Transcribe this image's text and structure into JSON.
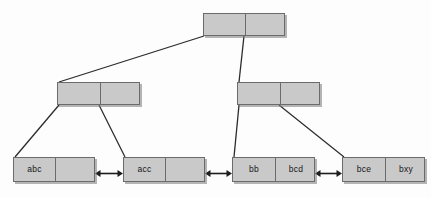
{
  "diagram": {
    "kind": "b-plus-tree",
    "title": "",
    "canvas": {
      "width": 431,
      "height": 197,
      "background": "#fdfdfd"
    },
    "style": {
      "node_fill": "#c9c9c9",
      "node_border": "#6b6b6b",
      "edge_color": "#2b2b2b",
      "text_color": "#16161a",
      "shadow_color": "#787878"
    },
    "levels": [
      {
        "name": "root-level",
        "nodes": [
          {
            "id": "root",
            "role": "root-node",
            "x": 203,
            "y": 13,
            "width": 82,
            "height": 23,
            "cells": [
              {
                "label": "",
                "width": 41
              },
              {
                "label": "",
                "width": 41
              }
            ]
          }
        ]
      },
      {
        "name": "internal-level",
        "nodes": [
          {
            "id": "internal-left",
            "role": "internal-node",
            "x": 57,
            "y": 82,
            "width": 83,
            "height": 23,
            "cells": [
              {
                "label": "",
                "width": 42
              },
              {
                "label": "",
                "width": 41
              }
            ]
          },
          {
            "id": "internal-right",
            "role": "internal-node",
            "x": 237,
            "y": 82,
            "width": 83,
            "height": 23,
            "cells": [
              {
                "label": "",
                "width": 42
              },
              {
                "label": "",
                "width": 41
              }
            ]
          }
        ]
      },
      {
        "name": "leaf-level",
        "nodes": [
          {
            "id": "leaf-abc",
            "role": "leaf-node",
            "x": 13,
            "y": 157,
            "width": 82,
            "height": 25,
            "cells": [
              {
                "label": "abc",
                "width": 41
              },
              {
                "label": "",
                "width": 41
              }
            ]
          },
          {
            "id": "leaf-acc",
            "role": "leaf-node",
            "x": 123,
            "y": 157,
            "width": 82,
            "height": 25,
            "cells": [
              {
                "label": "acc",
                "width": 41
              },
              {
                "label": "",
                "width": 41
              }
            ]
          },
          {
            "id": "leaf-bb-bcd",
            "role": "leaf-node",
            "x": 232,
            "y": 157,
            "width": 83,
            "height": 25,
            "cells": [
              {
                "label": "bb",
                "width": 42
              },
              {
                "label": "bcd",
                "width": 41
              }
            ]
          },
          {
            "id": "leaf-bce-bxy",
            "role": "leaf-node",
            "x": 342,
            "y": 157,
            "width": 83,
            "height": 25,
            "cells": [
              {
                "label": "bce",
                "width": 42
              },
              {
                "label": "bxy",
                "width": 41
              }
            ]
          }
        ]
      }
    ],
    "edges": [
      {
        "name": "edge-root-to-internal-left",
        "x1": 204,
        "y1": 36,
        "x2": 59,
        "y2": 82
      },
      {
        "name": "edge-root-to-internal-right",
        "x1": 244,
        "y1": 36,
        "x2": 239,
        "y2": 82
      },
      {
        "name": "edge-internal-left-to-leaf-abc",
        "x1": 59,
        "y1": 105,
        "x2": 15,
        "y2": 157
      },
      {
        "name": "edge-internal-left-to-leaf-acc",
        "x1": 99,
        "y1": 105,
        "x2": 125,
        "y2": 157
      },
      {
        "name": "edge-internal-right-to-leaf-bb",
        "x1": 239,
        "y1": 105,
        "x2": 234,
        "y2": 157
      },
      {
        "name": "edge-internal-right-to-leaf-bce",
        "x1": 279,
        "y1": 105,
        "x2": 344,
        "y2": 157
      }
    ],
    "leaf_links": [
      {
        "name": "leaf-link-abc-acc",
        "x": 95,
        "y": 165,
        "width": 28,
        "bidirectional": true
      },
      {
        "name": "leaf-link-acc-bb",
        "x": 205,
        "y": 165,
        "width": 27,
        "bidirectional": true
      },
      {
        "name": "leaf-link-bcd-bce",
        "x": 315,
        "y": 165,
        "width": 27,
        "bidirectional": true
      }
    ]
  }
}
